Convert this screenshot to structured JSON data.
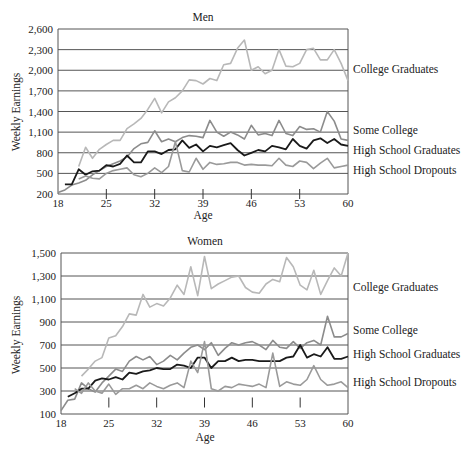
{
  "chart_data": [
    {
      "type": "line",
      "title": "Men",
      "xlabel": "Age",
      "ylabel": "Weekly Earnings",
      "xlim": [
        18,
        60
      ],
      "ylim": [
        200,
        2600
      ],
      "x_ticks": [
        "18",
        "25",
        "32",
        "39",
        "46",
        "53",
        "60"
      ],
      "y_ticks": [
        "200",
        "500",
        "800",
        "1,100",
        "1,400",
        "1,700",
        "2,000",
        "2,300",
        "2,600"
      ],
      "grid": "horizontal",
      "legend": "inline labels at right",
      "x": [
        18,
        19,
        20,
        21,
        22,
        23,
        24,
        25,
        26,
        27,
        28,
        29,
        30,
        31,
        32,
        33,
        34,
        35,
        36,
        37,
        38,
        39,
        40,
        41,
        42,
        43,
        44,
        45,
        46,
        47,
        48,
        49,
        50,
        51,
        52,
        53,
        54,
        55,
        56,
        57,
        58,
        59,
        60
      ],
      "series": [
        {
          "name": "College Graduates",
          "color": "#b8b8b8",
          "values": [
            null,
            null,
            null,
            600,
            880,
            720,
            850,
            920,
            980,
            980,
            1150,
            1220,
            1300,
            1430,
            1590,
            1380,
            1540,
            1600,
            1700,
            1860,
            1850,
            1800,
            1880,
            1850,
            2080,
            2100,
            2320,
            2440,
            2000,
            2050,
            1950,
            2000,
            2300,
            2060,
            2050,
            2100,
            2300,
            2320,
            2150,
            2150,
            2300,
            2100,
            1850
          ]
        },
        {
          "name": "Some College",
          "color": "#8c8c8c",
          "values": [
            220,
            260,
            330,
            360,
            400,
            480,
            540,
            600,
            640,
            680,
            740,
            860,
            930,
            950,
            1120,
            960,
            1000,
            960,
            1020,
            1050,
            1040,
            1020,
            1270,
            1100,
            1040,
            1100,
            1060,
            1000,
            1200,
            1060,
            1080,
            1050,
            1270,
            1080,
            1050,
            1180,
            1140,
            1150,
            1100,
            1400,
            1260,
            1000,
            980
          ]
        },
        {
          "name": "High School Graduates",
          "color": "#1a1a1a",
          "values": [
            null,
            340,
            340,
            560,
            480,
            530,
            540,
            620,
            600,
            640,
            760,
            660,
            660,
            820,
            820,
            780,
            840,
            850,
            980,
            870,
            920,
            820,
            900,
            880,
            910,
            940,
            840,
            760,
            800,
            840,
            820,
            900,
            880,
            850,
            1000,
            900,
            860,
            980,
            1010,
            940,
            1000,
            920,
            900
          ]
        },
        {
          "name": "High School Dropouts",
          "color": "#9a9a9a",
          "values": [
            null,
            null,
            null,
            420,
            460,
            430,
            420,
            500,
            540,
            560,
            580,
            480,
            450,
            500,
            580,
            510,
            600,
            960,
            540,
            520,
            720,
            560,
            660,
            630,
            640,
            660,
            660,
            620,
            630,
            620,
            620,
            610,
            720,
            620,
            600,
            680,
            660,
            570,
            650,
            720,
            580,
            600,
            620
          ]
        }
      ]
    },
    {
      "type": "line",
      "title": "Women",
      "xlabel": "Age",
      "ylabel": "Weekly Earnings",
      "xlim": [
        18,
        60
      ],
      "ylim": [
        100,
        1500
      ],
      "x_ticks": [
        "18",
        "25",
        "32",
        "39",
        "46",
        "53",
        "60"
      ],
      "y_ticks": [
        "100",
        "300",
        "500",
        "700",
        "900",
        "1,100",
        "1,300",
        "1,500"
      ],
      "grid": "horizontal",
      "legend": "inline labels at right",
      "x": [
        18,
        19,
        20,
        21,
        22,
        23,
        24,
        25,
        26,
        27,
        28,
        29,
        30,
        31,
        32,
        33,
        34,
        35,
        36,
        37,
        38,
        39,
        40,
        41,
        42,
        43,
        44,
        45,
        46,
        47,
        48,
        49,
        50,
        51,
        52,
        53,
        54,
        55,
        56,
        57,
        58,
        59,
        60
      ],
      "series": [
        {
          "name": "College Graduates",
          "color": "#b8b8b8",
          "values": [
            null,
            null,
            null,
            430,
            490,
            560,
            590,
            760,
            780,
            860,
            970,
            960,
            1140,
            1030,
            1060,
            1040,
            1110,
            1220,
            1140,
            1380,
            1130,
            1470,
            1190,
            1230,
            1260,
            1290,
            1300,
            1200,
            1160,
            1150,
            1230,
            1270,
            1250,
            1460,
            1380,
            1220,
            1180,
            1350,
            1140,
            1260,
            1370,
            1300,
            1500
          ]
        },
        {
          "name": "Some College",
          "color": "#8c8c8c",
          "values": [
            130,
            220,
            230,
            370,
            320,
            290,
            370,
            430,
            490,
            470,
            560,
            600,
            570,
            600,
            530,
            560,
            610,
            570,
            630,
            680,
            700,
            660,
            720,
            610,
            670,
            720,
            700,
            720,
            730,
            700,
            660,
            740,
            680,
            670,
            730,
            670,
            720,
            740,
            700,
            950,
            770,
            770,
            800
          ]
        },
        {
          "name": "High School Graduates",
          "color": "#1a1a1a",
          "values": [
            null,
            250,
            280,
            320,
            320,
            390,
            410,
            400,
            420,
            400,
            460,
            450,
            470,
            480,
            500,
            490,
            490,
            530,
            520,
            500,
            590,
            590,
            500,
            560,
            560,
            590,
            560,
            570,
            570,
            560,
            560,
            560,
            560,
            590,
            600,
            700,
            590,
            620,
            600,
            680,
            580,
            580,
            600
          ]
        },
        {
          "name": "High School Dropouts",
          "color": "#9a9a9a",
          "values": [
            null,
            null,
            320,
            280,
            370,
            300,
            280,
            360,
            270,
            320,
            320,
            350,
            320,
            370,
            340,
            320,
            350,
            370,
            330,
            560,
            460,
            730,
            320,
            300,
            340,
            330,
            360,
            350,
            340,
            360,
            330,
            630,
            340,
            380,
            360,
            350,
            400,
            520,
            400,
            350,
            360,
            380,
            330
          ]
        }
      ]
    }
  ],
  "men": {
    "title": "Men",
    "ylabel": "Weekly Earnings",
    "xlabel": "Age",
    "y_ticks": [
      "200",
      "500",
      "800",
      "1,100",
      "1,400",
      "1,700",
      "2,000",
      "2,300",
      "2,600"
    ],
    "x_ticks": [
      "18",
      "25",
      "32",
      "39",
      "46",
      "53",
      "60"
    ],
    "labels": [
      "College Graduates",
      "Some College",
      "High School Graduates",
      "High School Dropouts"
    ]
  },
  "women": {
    "title": "Women",
    "ylabel": "Weekly Earnings",
    "xlabel": "Age",
    "y_ticks": [
      "100",
      "300",
      "500",
      "700",
      "900",
      "1,100",
      "1,300",
      "1,500"
    ],
    "x_ticks": [
      "18",
      "25",
      "32",
      "39",
      "46",
      "53",
      "60"
    ],
    "labels": [
      "College Graduates",
      "Some College",
      "High School Graduates",
      "High School Dropouts"
    ]
  }
}
